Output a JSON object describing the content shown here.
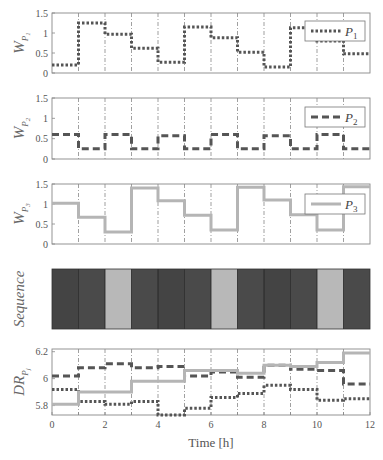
{
  "chart_data": {
    "type": "line",
    "subtype": "step",
    "x": [
      0,
      1,
      2,
      3,
      4,
      5,
      6,
      7,
      8,
      9,
      10,
      11,
      12
    ],
    "xlabel": "Time [h]",
    "xticks": [
      0,
      2,
      4,
      6,
      8,
      10,
      12
    ],
    "xlim": [
      0,
      12
    ],
    "grid": "vertical dash-dot at each hour",
    "colors": {
      "p1": "#555555",
      "p2": "#555555",
      "p3": "#b5b5b5",
      "axis": "#888888",
      "grid": "#777777"
    },
    "panels": [
      {
        "id": "wp1",
        "ylabel": "W",
        "ylabel_sub": "P1",
        "ylim": [
          0,
          1.5
        ],
        "yticks": [
          "0",
          "0.5",
          "1",
          "1.5"
        ],
        "legend": {
          "label": "P",
          "sub": "1",
          "style": "dotted"
        },
        "series": [
          {
            "name": "P1",
            "style": "dotted",
            "values": [
              0.2,
              1.25,
              0.97,
              0.62,
              0.27,
              1.15,
              0.88,
              0.52,
              0.15,
              1.13,
              0.8,
              0.48
            ]
          }
        ]
      },
      {
        "id": "wp2",
        "ylabel": "W",
        "ylabel_sub": "P2",
        "ylim": [
          0,
          1.5
        ],
        "yticks": [
          "0",
          "0.5",
          "1",
          "1.5"
        ],
        "legend": {
          "label": "P",
          "sub": "2",
          "style": "dashed"
        },
        "series": [
          {
            "name": "P2",
            "style": "dashed",
            "values": [
              0.6,
              0.25,
              0.6,
              0.25,
              0.57,
              0.25,
              0.6,
              0.25,
              0.57,
              0.25,
              0.6,
              0.25
            ]
          }
        ]
      },
      {
        "id": "wp3",
        "ylabel": "W",
        "ylabel_sub": "P3",
        "ylim": [
          0,
          1.5
        ],
        "yticks": [
          "0",
          "0.5",
          "1",
          "1.5"
        ],
        "legend": {
          "label": "P",
          "sub": "3",
          "style": "solid"
        },
        "series": [
          {
            "name": "P3",
            "style": "solid",
            "values": [
              1.02,
              0.67,
              0.3,
              1.4,
              1.08,
              0.72,
              0.35,
              1.42,
              1.1,
              0.73,
              0.35,
              1.43
            ]
          }
        ]
      },
      {
        "id": "sequence",
        "type": "heatmap",
        "ylabel": "Sequence",
        "blocks": [
          "#444444",
          "#4a4a4a",
          "#b8b8b8",
          "#4a4a4a",
          "#444444",
          "#4a4a4a",
          "#b8b8b8",
          "#4a4a4a",
          "#444444",
          "#4a4a4a",
          "#b8b8b8",
          "#4a4a4a"
        ],
        "block_labels": [
          "P1",
          "P2",
          "P3",
          "P2",
          "P1",
          "P2",
          "P3",
          "P2",
          "P1",
          "P2",
          "P3",
          "P2"
        ]
      },
      {
        "id": "dr",
        "ylabel": "DR",
        "ylabel_sub": "Pj",
        "ylim": [
          5.73,
          6.22
        ],
        "yticks": [
          "5.8",
          "6",
          "6.2"
        ],
        "series": [
          {
            "name": "P1",
            "style": "dotted",
            "values": [
              5.92,
              5.83,
              5.81,
              5.83,
              5.73,
              5.78,
              5.86,
              5.89,
              5.95,
              5.92,
              5.84,
              5.85
            ]
          },
          {
            "name": "P2",
            "style": "dashed",
            "values": [
              6.02,
              6.08,
              6.11,
              6.08,
              6.09,
              6.02,
              6.05,
              6.01,
              6.1,
              6.07,
              6.06,
              5.96
            ]
          },
          {
            "name": "P3",
            "style": "solid",
            "values": [
              5.81,
              5.9,
              5.9,
              5.98,
              5.98,
              6.06,
              6.06,
              6.04,
              6.1,
              6.09,
              6.12,
              6.19
            ]
          }
        ]
      }
    ]
  }
}
